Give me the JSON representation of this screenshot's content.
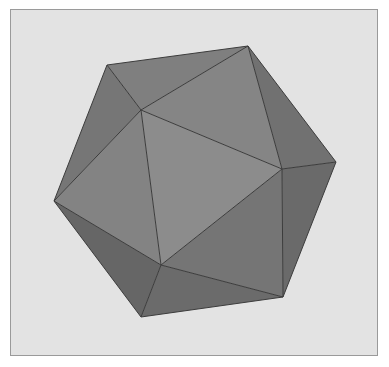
{
  "figure": {
    "background_color": "#e3e3e3",
    "edge_color": "#3c3c3c",
    "vertices": {
      "A": [
        107,
        65
      ],
      "B": [
        248,
        46
      ],
      "C": [
        141,
        110
      ],
      "D": [
        336,
        162
      ],
      "E": [
        282,
        169
      ],
      "F": [
        54,
        201
      ],
      "G": [
        161,
        265
      ],
      "H": [
        283,
        297
      ],
      "I": [
        141,
        317
      ]
    },
    "faces": [
      {
        "name": "top-left-face",
        "points": "107,65 248,46 141,110",
        "color": "#7f7f7f"
      },
      {
        "name": "top-right-face",
        "points": "248,46 282,169 141,110",
        "color": "#858585"
      },
      {
        "name": "right-upper-face",
        "points": "248,46 336,162 282,169",
        "color": "#717171"
      },
      {
        "name": "left-upper-face",
        "points": "107,65 141,110 54,201",
        "color": "#767676"
      },
      {
        "name": "left-face",
        "points": "54,201 141,110 161,265",
        "color": "#838383"
      },
      {
        "name": "front-face",
        "points": "141,110 282,169 161,265",
        "color": "#8c8c8c"
      },
      {
        "name": "right-lower-face",
        "points": "282,169 283,297 161,265",
        "color": "#757575"
      },
      {
        "name": "right-edge-face",
        "points": "282,169 336,162 283,297",
        "color": "#6a6a6a"
      },
      {
        "name": "bottom-left-face",
        "points": "54,201 161,265 141,317",
        "color": "#666666"
      },
      {
        "name": "bottom-face",
        "points": "161,265 283,297 141,317",
        "color": "#6b6b6b"
      }
    ]
  }
}
